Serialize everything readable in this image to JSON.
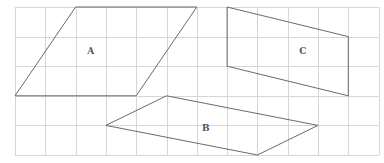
{
  "diagram": {
    "grid": {
      "origin_x": 15,
      "origin_y": 7,
      "cell_w": 30.3,
      "cell_h": 29.6,
      "cols": 12,
      "rows": 5,
      "color": "#d6d6d6"
    },
    "stroke_color": "#6a6a6a",
    "shapes": [
      {
        "label": "A",
        "type": "parallelogram",
        "vertices_grid": [
          [
            0,
            3
          ],
          [
            2,
            0
          ],
          [
            6,
            0
          ],
          [
            4,
            3
          ]
        ],
        "label_grid": [
          2.5,
          1.5
        ]
      },
      {
        "label": "B",
        "type": "parallelogram",
        "vertices_grid": [
          [
            3,
            4
          ],
          [
            5,
            3
          ],
          [
            10,
            4
          ],
          [
            8,
            5
          ]
        ],
        "label_grid": [
          6.3,
          4.1
        ]
      },
      {
        "label": "C",
        "type": "parallelogram",
        "vertices_grid": [
          [
            7,
            0
          ],
          [
            11,
            1
          ],
          [
            11,
            3
          ],
          [
            7,
            2
          ]
        ],
        "label_grid": [
          9.5,
          1.5
        ]
      }
    ]
  }
}
